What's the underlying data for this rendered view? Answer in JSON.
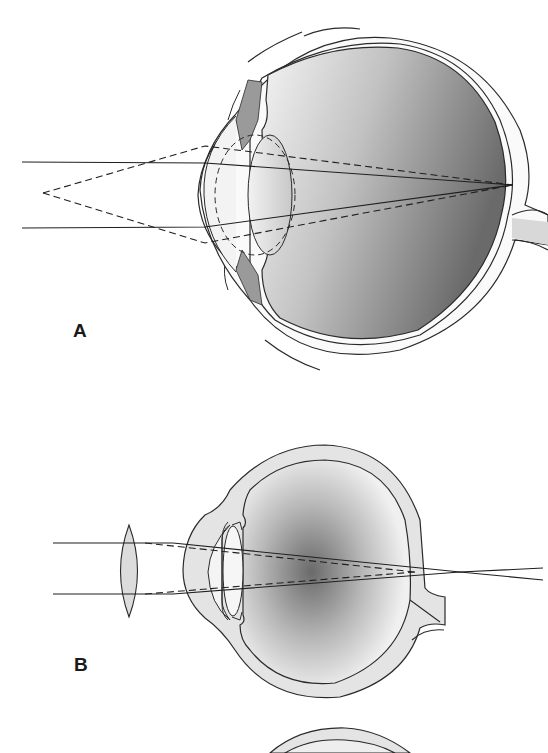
{
  "figure": {
    "panels": [
      {
        "label": "A",
        "subject": "eye-nearsighted-near-object",
        "description": "Parallel rays and diverging rays from a near point both converge at the retina through accommodated lens"
      },
      {
        "label": "B",
        "subject": "eye-with-convex-corrective-lens",
        "description": "Convex lens in front of eye converges parallel rays; focus falls behind retina"
      }
    ],
    "colors": {
      "line": "#2a2a2a",
      "sclera_fill": "#e4e4e4",
      "vitreous_dark": "#6f6f6f",
      "vitreous_light": "#f2f2f2",
      "background": "#ffffff"
    }
  }
}
